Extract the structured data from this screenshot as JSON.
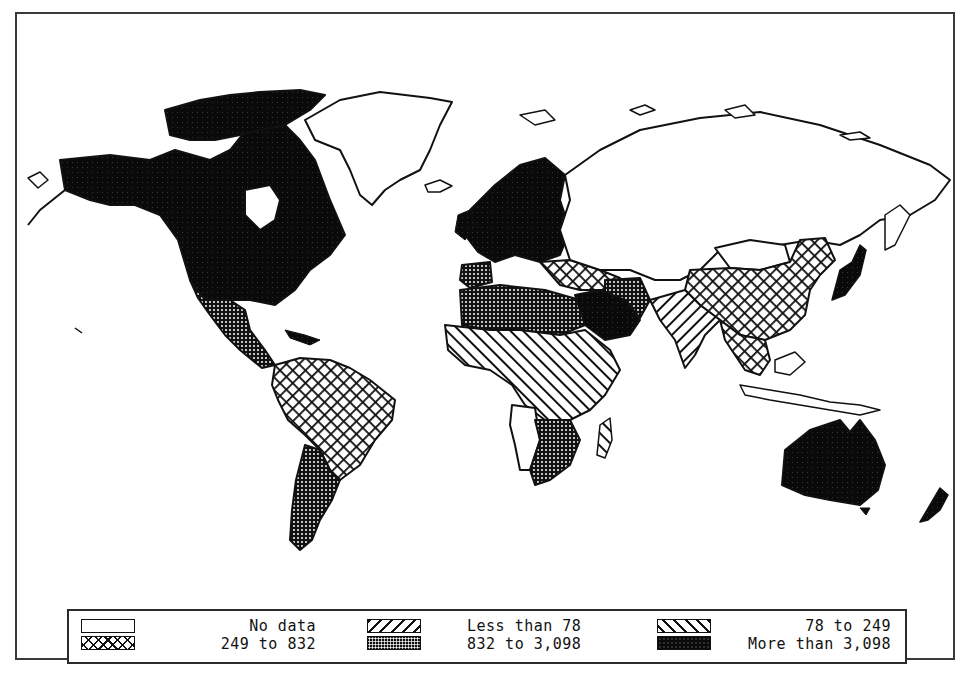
{
  "figure": {
    "type": "choropleth world map",
    "frame": {
      "border_color": "#3a3a3a"
    }
  },
  "legend": {
    "columns": [
      {
        "rows": [
          {
            "label": "No data",
            "pattern": "none",
            "icon": "empty-swatch-icon"
          },
          {
            "label": "249 to 832",
            "pattern": "cross-hatch",
            "icon": "cross-hatch-swatch-icon"
          }
        ]
      },
      {
        "rows": [
          {
            "label": "Less than 78",
            "pattern": "forward-diagonal-hatch",
            "icon": "forward-hatch-swatch-icon"
          },
          {
            "label": "832 to 3,098",
            "pattern": "fine-dots",
            "icon": "dots-swatch-icon"
          }
        ]
      },
      {
        "rows": [
          {
            "label": "78 to 249",
            "pattern": "backward-diagonal-hatch",
            "icon": "backward-hatch-swatch-icon"
          },
          {
            "label": "More than 3,098",
            "pattern": "solid-black",
            "icon": "solid-swatch-icon"
          }
        ]
      }
    ]
  },
  "regions": [
    {
      "name": "North America (US/Canada)",
      "category": "More than 3,098"
    },
    {
      "name": "Greenland",
      "category": "No data"
    },
    {
      "name": "Mexico & Central America",
      "category": "832 to 3,098"
    },
    {
      "name": "South America (north/Brazil)",
      "category": "249 to 832"
    },
    {
      "name": "Southern Cone (Argentina/Chile)",
      "category": "832 to 3,098"
    },
    {
      "name": "Western & Northern Europe",
      "category": "More than 3,098"
    },
    {
      "name": "Eastern Europe / Turkey",
      "category": "249 to 832"
    },
    {
      "name": "Soviet Union",
      "category": "No data"
    },
    {
      "name": "North Africa",
      "category": "832 to 3,098"
    },
    {
      "name": "Arabian Peninsula",
      "category": "More than 3,098"
    },
    {
      "name": "Iran",
      "category": "832 to 3,098"
    },
    {
      "name": "Sub-Saharan Africa",
      "category": "Less than 78"
    },
    {
      "name": "Angola / Namibia",
      "category": "No data"
    },
    {
      "name": "Southern Africa",
      "category": "832 to 3,098"
    },
    {
      "name": "South Asia (India)",
      "category": "78 to 249"
    },
    {
      "name": "China",
      "category": "249 to 832"
    },
    {
      "name": "Mongolia",
      "category": "No data"
    },
    {
      "name": "Japan",
      "category": "More than 3,098"
    },
    {
      "name": "Southeast Asia",
      "category": "249 to 832"
    },
    {
      "name": "Australia",
      "category": "More than 3,098"
    },
    {
      "name": "New Zealand",
      "category": "More than 3,098"
    }
  ]
}
